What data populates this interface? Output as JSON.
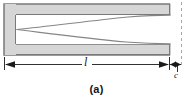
{
  "figure": {
    "caption": "(a)",
    "labels": {
      "length": "l",
      "gap": "c"
    },
    "colors": {
      "bar_fill": "#d0d0d0",
      "bar_edge": "#8a8a8a",
      "frame_edge": "#9a9a9a",
      "curve": "#808080",
      "dimension_line": "#1a1a1a",
      "dashed_line": "#a0a0a0",
      "background": "#ffffff",
      "text": "#1a1a1a"
    },
    "elements": {
      "outer_frame": "rectangular-channel-outline",
      "top_bar": "upper-beam",
      "bottom_bar": "lower-beam",
      "left_end": "closed-left-end",
      "crack_curves": "two-curves-converging-to-point",
      "datum": "vertical-dashed-reference-line",
      "dimension_length": "double-headed-arrow-spanning-beam-length",
      "dimension_gap": "short-double-headed-arrow-at-right-end"
    }
  }
}
